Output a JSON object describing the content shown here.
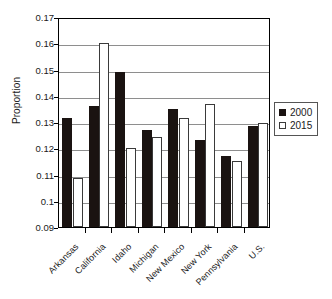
{
  "chart_data": {
    "type": "bar",
    "title": "",
    "subtitle": "",
    "xlabel": "",
    "ylabel": "Proportion",
    "categories": [
      "Arkansas",
      "California",
      "Idaho",
      "Michigan",
      "New Mexico",
      "New York",
      "Pennsylvania",
      "U.S."
    ],
    "series": [
      {
        "name": "2000",
        "color": "#1a1311",
        "values": [
          0.1315,
          0.1362,
          0.1492,
          0.1268,
          0.1348,
          0.1233,
          0.117,
          0.1285
        ]
      },
      {
        "name": "2015",
        "color": "#ffffff",
        "values": [
          0.1085,
          0.16,
          0.12,
          0.1242,
          0.1315,
          0.1367,
          0.115,
          0.1295
        ]
      }
    ],
    "ylim": [
      0.09,
      0.17
    ],
    "ytick_labels": [
      "0.17",
      "0.16",
      "0.15",
      "0.14",
      "0.13",
      "0.12",
      "0.11",
      "0.1",
      "0.09"
    ],
    "ytick_values": [
      0.17,
      0.16,
      0.15,
      0.14,
      0.13,
      0.12,
      0.11,
      0.1,
      0.09
    ],
    "grid": true,
    "grid_axis": "y",
    "legend_position": "right",
    "legend_entries": [
      "2000",
      "2015"
    ]
  }
}
